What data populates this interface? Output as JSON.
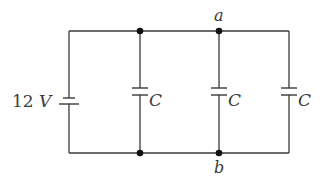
{
  "diagram": {
    "type": "circuit",
    "battery": {
      "label_value": "12",
      "label_unit": "V"
    },
    "capacitors": [
      {
        "label": "C"
      },
      {
        "label": "C"
      },
      {
        "label": "C"
      }
    ],
    "nodes": [
      {
        "label": "a"
      },
      {
        "label": "b"
      }
    ],
    "colors": {
      "wire": "#3a3a3a",
      "node": "#111111",
      "background": "#ffffff"
    }
  }
}
